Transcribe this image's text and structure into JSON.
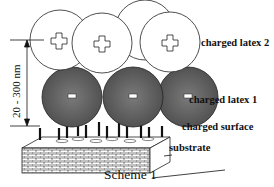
{
  "figure": {
    "caption": "Scheme 1",
    "labels": {
      "latex2": "charged latex 2",
      "latex1": "charged latex 1",
      "surface": "charged surface",
      "substrate": "substrate"
    },
    "dimension": "20 - 300 nm",
    "latex2": {
      "charge": "+",
      "fill": "#ffffff",
      "count": 4
    },
    "latex1": {
      "charge": "-",
      "fill": "#6e6e6e",
      "count": 3
    }
  }
}
